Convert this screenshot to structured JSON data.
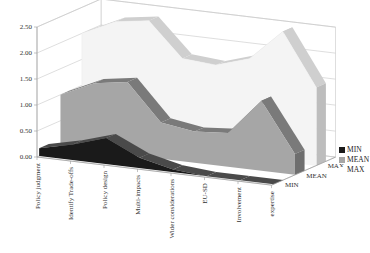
{
  "chart_data": {
    "type": "area",
    "variant": "3d-area",
    "title": "",
    "xlabel": "",
    "ylabel": "",
    "ylim": [
      0,
      2.5
    ],
    "yticks": [
      "0.00",
      "0.50",
      "1.00",
      "1.50",
      "2.00",
      "2.50"
    ],
    "categories": [
      "Policy judgment",
      "Identify Trade-offs",
      "Policy design",
      "Multi-impacts",
      "Wider considerations",
      "EU-SD",
      "Involvement",
      "expertise"
    ],
    "depth_labels": [
      "MIN",
      "MEAN",
      "MAX"
    ],
    "series": [
      {
        "name": "MIN",
        "color": "#1a1a1a",
        "values": [
          0.15,
          0.3,
          0.5,
          0.2,
          0.05,
          0.0,
          0.0,
          0.0
        ]
      },
      {
        "name": "MEAN",
        "color": "#a6a6a6",
        "values": [
          1.0,
          1.3,
          1.4,
          0.7,
          0.6,
          0.65,
          1.35,
          0.4
        ]
      },
      {
        "name": "MAX",
        "color": "#f4f4f4",
        "values": [
          2.0,
          2.3,
          2.4,
          1.75,
          1.7,
          1.9,
          2.5,
          1.5
        ]
      }
    ],
    "legend_position": "right",
    "grid": true
  },
  "legend": {
    "items": [
      {
        "label": "MIN",
        "color": "#1a1a1a"
      },
      {
        "label": "MEAN",
        "color": "#a6a6a6"
      },
      {
        "label": "MAX",
        "color": "#f4f4f4"
      }
    ]
  }
}
